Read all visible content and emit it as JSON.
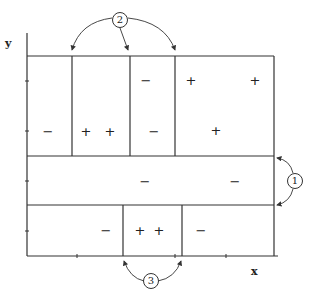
{
  "diagram": {
    "axes": {
      "x_label": "x",
      "y_label": "y"
    },
    "callouts": [
      {
        "id": "1",
        "label": "1",
        "x": 295,
        "y": 181
      },
      {
        "id": "2",
        "label": "2",
        "x": 120,
        "y": 20
      },
      {
        "id": "3",
        "label": "3",
        "x": 151,
        "y": 281
      }
    ],
    "signs": [
      {
        "text": "−",
        "x": 48,
        "y": 131
      },
      {
        "text": "+",
        "x": 86,
        "y": 131
      },
      {
        "text": "+",
        "x": 110,
        "y": 131
      },
      {
        "text": "−",
        "x": 154,
        "y": 131
      },
      {
        "text": "−",
        "x": 146,
        "y": 80
      },
      {
        "text": "+",
        "x": 191,
        "y": 80
      },
      {
        "text": "+",
        "x": 255,
        "y": 80
      },
      {
        "text": "+",
        "x": 216,
        "y": 130
      },
      {
        "text": "−",
        "x": 145,
        "y": 181
      },
      {
        "text": "−",
        "x": 235,
        "y": 181
      },
      {
        "text": "−",
        "x": 106,
        "y": 230
      },
      {
        "text": "+",
        "x": 140,
        "y": 230
      },
      {
        "text": "+",
        "x": 159,
        "y": 230
      },
      {
        "text": "−",
        "x": 201,
        "y": 230
      }
    ],
    "colors": {
      "line": "#333333",
      "background": "#ffffff"
    }
  }
}
